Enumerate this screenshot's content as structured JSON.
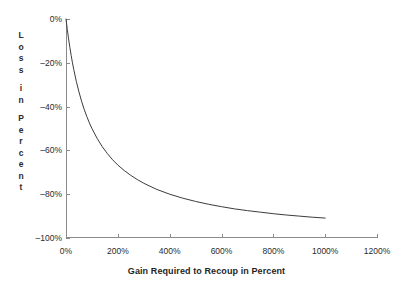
{
  "chart_data": {
    "type": "line",
    "title": "",
    "subtitle": "",
    "xlabel": "Gain Required to Recoup in Percent",
    "ylabel": "Loss in Percent",
    "ylabel_stacked": [
      "L",
      "o",
      "s",
      "s",
      "",
      "i",
      "n",
      "",
      "P",
      "e",
      "r",
      "c",
      "e",
      "n",
      "t"
    ],
    "xlim": [
      0,
      1200
    ],
    "ylim": [
      -100,
      0
    ],
    "grid": false,
    "legend": null,
    "legend_position": "none",
    "xticks": [
      0,
      200,
      400,
      600,
      800,
      1000,
      1200
    ],
    "xtick_labels": [
      "0%",
      "200%",
      "400%",
      "600%",
      "800%",
      "1000%",
      "1200%"
    ],
    "yticks": [
      0,
      -20,
      -40,
      -60,
      -80,
      -100
    ],
    "ytick_labels": [
      "0%",
      "–20%",
      "–40%",
      "–60%",
      "–80%",
      "–100%"
    ],
    "series": [
      {
        "name": "Loss vs Gain Required to Recoup",
        "color": "#3c3c3c",
        "x": [
          0,
          5,
          10,
          15,
          20,
          25,
          30,
          40,
          50,
          60,
          70,
          80,
          90,
          100,
          120,
          140,
          160,
          180,
          200,
          225,
          250,
          275,
          300,
          350,
          400,
          450,
          500,
          550,
          600,
          650,
          700,
          750,
          800,
          850,
          900,
          950,
          1000
        ],
        "y": [
          0,
          -4.8,
          -9.1,
          -13,
          -16.7,
          -20,
          -23.1,
          -28.6,
          -33.3,
          -37.5,
          -41.2,
          -44.4,
          -47.4,
          -50,
          -54.5,
          -58.3,
          -61.5,
          -64.3,
          -66.7,
          -69.2,
          -71.4,
          -73.3,
          -75,
          -77.8,
          -80,
          -81.8,
          -83.3,
          -84.6,
          -85.7,
          -86.7,
          -87.5,
          -88.2,
          -88.9,
          -89.5,
          -90,
          -90.5,
          -90.9
        ]
      }
    ],
    "axis_color": "#8a8a8a",
    "line_color": "#3c3c3c",
    "background_color": "#ffffff",
    "text_color": "#2b2b2b"
  },
  "plot_geometry": {
    "left": 66,
    "right": 377,
    "top": 19,
    "bottom": 238
  }
}
